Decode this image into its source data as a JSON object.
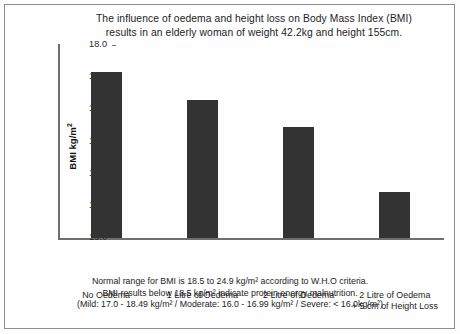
{
  "chart_data": {
    "type": "bar",
    "title": "The influence of oedema and height loss on Body Mass Index (BMI) results in an elderly woman of weight 42.2kg and height 155cm.",
    "title_lines": [
      "The influence of oedema and height loss on Body Mass Index (BMI)",
      "results in an elderly woman of weight 42.2kg and height 155cm."
    ],
    "categories": [
      "No Oedema",
      "1 Litre of Oedema",
      "2 Litre of Oedema",
      "2 Litre of Oedema + 5 cm of Height Loss"
    ],
    "category_lines": [
      [
        "No Oedema"
      ],
      [
        "1 Litre of Oedema"
      ],
      [
        "2 Litre of Oedema"
      ],
      [
        "2 Litre of Oedema",
        "+ 5 cm of Height Loss"
      ]
    ],
    "values": [
      17.58,
      17.15,
      16.73,
      15.72
    ],
    "xlabel": "",
    "ylabel": "BMI kg/m²",
    "ylim": [
      15.0,
      18.0
    ],
    "yticks": [
      "18.0",
      "17.5",
      "17.0",
      "16.5",
      "16.0",
      "15.5",
      "15.0"
    ],
    "ytick_values": [
      18.0,
      17.5,
      17.0,
      16.5,
      16.0,
      15.5,
      15.0
    ],
    "grid": false,
    "legend": "none",
    "bar_color": "#333333",
    "axis_color": "#6f6f6f",
    "background_color": "#fefefe",
    "border_color": "#8d8d8d",
    "annotations": [
      "Normal range for BMI is 18.5 to 24.9 kg/m² according to W.H.O criteria.",
      "BMI results below 18.5 kg/m² indicate protein energy malnutrition.",
      "(Mild: 17.0 - 18.49 kg/m² / Moderate: 16.0 - 16.99 kg/m² / Severe: < 16.0kg/m²)"
    ]
  }
}
